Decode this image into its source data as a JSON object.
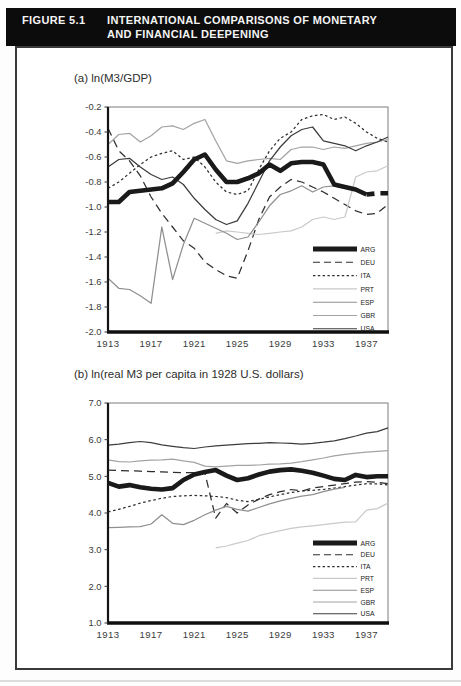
{
  "figure": {
    "label": "FIGURE 5.1",
    "title_line1": "INTERNATIONAL COMPARISONS OF MONETARY",
    "title_line2": "AND FINANCIAL DEEPENING"
  },
  "colors": {
    "arg": "#1a1a1a",
    "deu": "#2e2e2e",
    "ita": "#2e2e2e",
    "prt": "#c9c9c9",
    "esp": "#8f8f8f",
    "gbr": "#a3a3a3",
    "usa": "#3c3c3c"
  },
  "chart_data": [
    {
      "type": "line",
      "id": "a",
      "title": "(a) ln(M3/GDP)",
      "ylim": [
        -2.0,
        -0.2
      ],
      "grid": false,
      "legend_position": "inside-lower-right",
      "ytick_values": [
        -0.2,
        -0.4,
        -0.6,
        -0.8,
        -1.0,
        -1.2,
        -1.4,
        -1.6,
        -1.8,
        -2.0
      ],
      "ytick_labels": [
        "-0.2",
        "-0.4",
        "-0.6",
        "-0.8",
        "-1.0",
        "-1.2",
        "-1.4",
        "-1.6",
        "-1.8",
        "-2.0"
      ],
      "xtick_values": [
        1913,
        1917,
        1921,
        1925,
        1929,
        1933,
        1937
      ],
      "xtick_labels": [
        "1913",
        "1917",
        "1921",
        "1925",
        "1929",
        "1933",
        "1937"
      ],
      "years": [
        1913,
        1914,
        1915,
        1916,
        1917,
        1918,
        1919,
        1920,
        1921,
        1922,
        1923,
        1924,
        1925,
        1926,
        1927,
        1928,
        1929,
        1930,
        1931,
        1932,
        1933,
        1934,
        1935,
        1936,
        1937,
        1938,
        1939
      ],
      "series": [
        {
          "name": "ARG",
          "dash": "solid",
          "width": 4.6,
          "color": "#1a1a1a",
          "dash_from_year": 1937,
          "values": [
            -0.96,
            -0.96,
            -0.88,
            -0.87,
            -0.86,
            -0.85,
            -0.81,
            -0.72,
            -0.62,
            -0.58,
            -0.7,
            -0.8,
            -0.8,
            -0.77,
            -0.73,
            -0.66,
            -0.71,
            -0.65,
            -0.64,
            -0.64,
            -0.66,
            -0.82,
            -0.84,
            -0.86,
            -0.9,
            -0.89,
            -0.89
          ]
        },
        {
          "name": "DEU",
          "dash": "long",
          "width": 1.25,
          "color": "#2e2e2e",
          "values": [
            -0.37,
            -0.55,
            -0.63,
            -0.75,
            -0.92,
            -1.05,
            -1.16,
            -1.27,
            -1.33,
            -1.44,
            -1.5,
            -1.55,
            -1.57,
            -1.35,
            -1.1,
            -0.92,
            -0.84,
            -0.78,
            -0.8,
            -0.84,
            -0.88,
            -0.93,
            -0.98,
            -1.03,
            -1.06,
            -1.05,
            -0.98
          ]
        },
        {
          "name": "ITA",
          "dash": "short",
          "width": 1.25,
          "color": "#2e2e2e",
          "values": [
            -0.85,
            -0.8,
            -0.73,
            -0.66,
            -0.6,
            -0.57,
            -0.55,
            -0.62,
            -0.6,
            -0.68,
            -0.8,
            -0.88,
            -0.9,
            -0.87,
            -0.7,
            -0.55,
            -0.45,
            -0.4,
            -0.3,
            -0.27,
            -0.26,
            -0.3,
            -0.28,
            -0.33,
            -0.4,
            -0.45,
            -0.48
          ]
        },
        {
          "name": "PRT",
          "dash": "solid",
          "width": 1.25,
          "color": "#c9c9c9",
          "values": [
            null,
            null,
            null,
            null,
            null,
            null,
            null,
            null,
            null,
            null,
            -1.21,
            -1.19,
            -1.2,
            -1.21,
            -1.22,
            -1.21,
            -1.2,
            -1.19,
            -1.16,
            -1.1,
            -1.08,
            -1.1,
            -1.08,
            -0.76,
            -0.72,
            -0.71,
            -0.67
          ]
        },
        {
          "name": "ESP",
          "dash": "solid",
          "width": 1.25,
          "color": "#8f8f8f",
          "values": [
            -1.57,
            -1.65,
            -1.66,
            -1.71,
            -1.77,
            -1.16,
            -1.58,
            -1.3,
            -1.09,
            -1.13,
            -1.17,
            -1.21,
            -1.26,
            -1.24,
            -1.12,
            -0.99,
            -0.9,
            -0.87,
            -0.83,
            -0.88,
            -0.84,
            -0.83,
            -0.85,
            null,
            null,
            null,
            null
          ]
        },
        {
          "name": "GBR",
          "dash": "solid",
          "width": 1.25,
          "color": "#a3a3a3",
          "values": [
            -0.5,
            -0.42,
            -0.41,
            -0.48,
            -0.43,
            -0.36,
            -0.35,
            -0.38,
            -0.33,
            -0.3,
            -0.47,
            -0.63,
            -0.65,
            -0.63,
            -0.62,
            -0.61,
            -0.62,
            -0.54,
            -0.52,
            -0.52,
            -0.54,
            -0.52,
            -0.53,
            -0.51,
            -0.49,
            -0.48,
            -0.46
          ]
        },
        {
          "name": "USA",
          "dash": "solid",
          "width": 1.25,
          "color": "#3c3c3c",
          "values": [
            -0.68,
            -0.62,
            -0.61,
            -0.68,
            -0.74,
            -0.78,
            -0.76,
            -0.82,
            -0.93,
            -1.02,
            -1.1,
            -1.14,
            -1.11,
            -0.97,
            -0.8,
            -0.63,
            -0.52,
            -0.43,
            -0.38,
            -0.36,
            -0.47,
            -0.49,
            -0.51,
            -0.55,
            -0.51,
            -0.48,
            -0.44
          ]
        }
      ]
    },
    {
      "type": "line",
      "id": "b",
      "title": "(b) ln(real M3 per capita in 1928 U.S. dollars)",
      "ylim": [
        1.0,
        7.0
      ],
      "grid": false,
      "legend_position": "inside-lower-right",
      "ytick_values": [
        7.0,
        6.0,
        5.0,
        4.0,
        3.0,
        2.0,
        1.0
      ],
      "ytick_labels": [
        "7.0",
        "6.0",
        "5.0",
        "4.0",
        "3.0",
        "2.0",
        "1.0"
      ],
      "xtick_values": [
        1913,
        1917,
        1921,
        1925,
        1929,
        1933,
        1937
      ],
      "xtick_labels": [
        "1913",
        "1917",
        "1921",
        "1925",
        "1929",
        "1933",
        "1937"
      ],
      "years": [
        1913,
        1914,
        1915,
        1916,
        1917,
        1918,
        1919,
        1920,
        1921,
        1922,
        1923,
        1924,
        1925,
        1926,
        1927,
        1928,
        1929,
        1930,
        1931,
        1932,
        1933,
        1934,
        1935,
        1936,
        1937,
        1938,
        1939
      ],
      "series": [
        {
          "name": "ARG",
          "dash": "solid",
          "width": 4.6,
          "color": "#1a1a1a",
          "values": [
            4.82,
            4.72,
            4.76,
            4.7,
            4.66,
            4.64,
            4.68,
            4.9,
            5.05,
            5.12,
            5.17,
            5.02,
            4.9,
            4.95,
            5.05,
            5.13,
            5.17,
            5.19,
            5.15,
            5.1,
            5.02,
            4.93,
            4.9,
            5.04,
            4.98,
            5.0,
            5.0
          ]
        },
        {
          "name": "DEU",
          "dash": "long",
          "width": 1.25,
          "color": "#2e2e2e",
          "values": [
            5.17,
            5.16,
            5.15,
            5.14,
            5.13,
            5.12,
            5.11,
            5.1,
            5.1,
            5.09,
            3.86,
            4.26,
            4.0,
            4.22,
            4.38,
            4.5,
            4.58,
            4.64,
            4.6,
            4.68,
            4.72,
            4.76,
            4.8,
            4.84,
            4.86,
            4.84,
            4.8
          ]
        },
        {
          "name": "ITA",
          "dash": "short",
          "width": 1.25,
          "color": "#2e2e2e",
          "values": [
            4.03,
            4.1,
            4.18,
            4.27,
            4.34,
            4.4,
            4.45,
            4.47,
            4.48,
            4.47,
            4.45,
            4.42,
            4.35,
            4.31,
            4.37,
            4.44,
            4.5,
            4.56,
            4.6,
            4.62,
            4.64,
            4.68,
            4.72,
            4.76,
            4.8,
            4.79,
            4.77
          ]
        },
        {
          "name": "PRT",
          "dash": "solid",
          "width": 1.25,
          "color": "#c9c9c9",
          "values": [
            null,
            null,
            null,
            null,
            null,
            null,
            null,
            null,
            null,
            null,
            3.05,
            3.1,
            3.18,
            3.25,
            3.38,
            3.45,
            3.52,
            3.58,
            3.62,
            3.65,
            3.68,
            3.72,
            3.75,
            3.76,
            4.08,
            4.12,
            4.27
          ]
        },
        {
          "name": "ESP",
          "dash": "solid",
          "width": 1.25,
          "color": "#8f8f8f",
          "values": [
            3.6,
            3.61,
            3.62,
            3.63,
            3.7,
            3.95,
            3.72,
            3.68,
            3.8,
            3.95,
            4.08,
            4.18,
            4.1,
            4.05,
            4.15,
            4.25,
            4.33,
            4.4,
            4.46,
            4.5,
            4.58,
            4.65,
            4.7,
            null,
            null,
            null,
            null
          ]
        },
        {
          "name": "GBR",
          "dash": "solid",
          "width": 1.25,
          "color": "#a3a3a3",
          "values": [
            5.45,
            5.4,
            5.39,
            5.42,
            5.44,
            5.45,
            5.47,
            5.42,
            5.38,
            5.28,
            5.26,
            5.28,
            5.3,
            5.3,
            5.31,
            5.33,
            5.34,
            5.36,
            5.4,
            5.45,
            5.5,
            5.56,
            5.6,
            5.63,
            5.66,
            5.68,
            5.7
          ]
        },
        {
          "name": "USA",
          "dash": "solid",
          "width": 1.25,
          "color": "#3c3c3c",
          "values": [
            5.85,
            5.88,
            5.92,
            5.95,
            5.92,
            5.86,
            5.82,
            5.78,
            5.76,
            5.8,
            5.83,
            5.85,
            5.87,
            5.89,
            5.9,
            5.92,
            5.91,
            5.9,
            5.88,
            5.9,
            5.93,
            5.97,
            6.03,
            6.1,
            6.18,
            6.22,
            6.32
          ]
        }
      ]
    }
  ]
}
